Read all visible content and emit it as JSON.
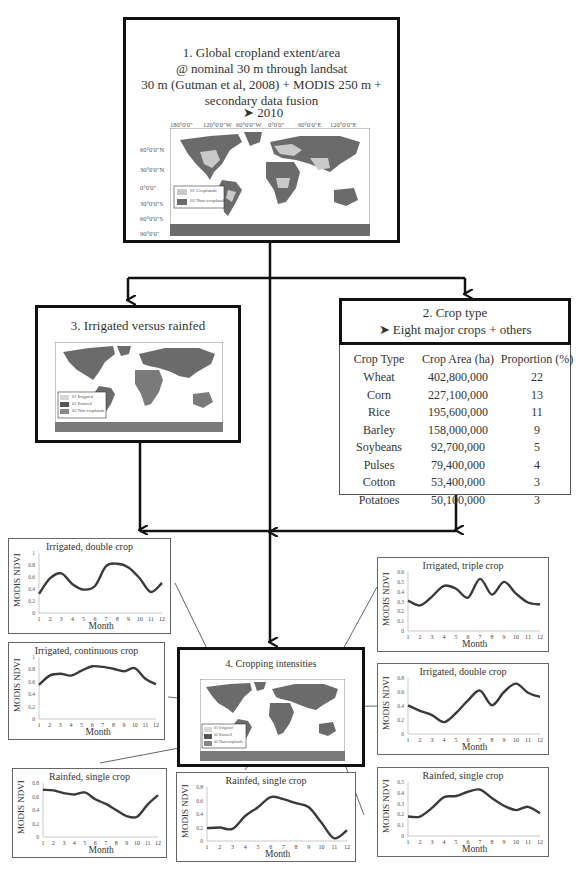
{
  "box1": {
    "title_lines": [
      "1. Global cropland extent/area",
      "@ nominal 30 m through landsat",
      "30 m  (Gutman et al, 2008) + MODIS 250 m +",
      "secondary data fusion"
    ],
    "bullets": [
      "2010",
      "1990"
    ],
    "map": {
      "top_ticks": [
        "180°0'0\"",
        "120°0'0\"W",
        "60°0'0\"W",
        "0°0'0\"",
        "60°0'0\"E",
        "120°0'0\"E"
      ],
      "left_ticks": [
        "60°0'0\"N",
        "30°0'0\"N",
        "0°0'0\"",
        "30°0'0\"S",
        "60°0'0\"S",
        "90°0'0\""
      ],
      "legend": [
        "01 Croplands",
        "02 Non-croplands"
      ]
    }
  },
  "box2": {
    "title": "2. Crop type",
    "bullet": "Eight major crops + others",
    "table": {
      "headers": [
        "Crop Type",
        "Crop Area (ha)",
        "Proportion (%)"
      ],
      "rows": [
        [
          "Wheat",
          "402,800,000",
          "22"
        ],
        [
          "Corn",
          "227,100,000",
          "13"
        ],
        [
          "Rice",
          "195,600,000",
          "11"
        ],
        [
          "Barley",
          "158,000,000",
          "9"
        ],
        [
          "Soybeans",
          "92,700,000",
          "5"
        ],
        [
          "Pulses",
          "79,400,000",
          "4"
        ],
        [
          "Cotton",
          "53,400,000",
          "3"
        ],
        [
          "Potatoes",
          "50,100,000",
          "3"
        ]
      ]
    }
  },
  "box3": {
    "title": "3. Irrigated versus rainfed",
    "legend": [
      "01 Irrigated",
      "02 Rainfed",
      "03 Non-croplands"
    ]
  },
  "box4": {
    "title": "4. Cropping intensities",
    "legend": [
      "01 Irrigated",
      "02 Rainfed",
      "03 Non-croplands"
    ]
  },
  "colors": {
    "land_dark": "#6b6b6b",
    "land_light": "#c9c9c9",
    "line": "#3a3a3a",
    "border": "#111111"
  },
  "chart_data": [
    {
      "type": "line",
      "title": "Irrigated, double crop",
      "xlabel": "Month",
      "ylabel": "MODIS NDVI",
      "x": [
        1,
        2,
        3,
        4,
        5,
        6,
        7,
        8,
        9,
        10,
        11,
        12
      ],
      "values": [
        0.32,
        0.58,
        0.66,
        0.48,
        0.39,
        0.45,
        0.78,
        0.82,
        0.76,
        0.58,
        0.35,
        0.5
      ],
      "ylim": [
        0,
        1
      ],
      "yticks": [
        "0",
        "0.2",
        "0.4",
        "0.6",
        "0.8",
        "1"
      ]
    },
    {
      "type": "line",
      "title": "Irrigated, continuous crop",
      "xlabel": "Month",
      "ylabel": "MODIS NDVI",
      "x": [
        1,
        2,
        3,
        4,
        5,
        6,
        7,
        8,
        9,
        10,
        11,
        12
      ],
      "values": [
        0.55,
        0.7,
        0.73,
        0.7,
        0.78,
        0.85,
        0.84,
        0.81,
        0.77,
        0.82,
        0.65,
        0.56
      ],
      "ylim": [
        0,
        1
      ],
      "yticks": [
        "0",
        "0.2",
        "0.4",
        "0.6",
        "0.8",
        "1"
      ]
    },
    {
      "type": "line",
      "title": "Rainfed, single crop",
      "xlabel": "Month",
      "ylabel": "MODIS NDVI",
      "x": [
        1,
        2,
        3,
        4,
        5,
        6,
        7,
        8,
        9,
        10,
        11,
        12
      ],
      "values": [
        0.7,
        0.69,
        0.65,
        0.63,
        0.66,
        0.56,
        0.49,
        0.4,
        0.31,
        0.3,
        0.48,
        0.62
      ],
      "ylim": [
        0,
        0.8
      ],
      "yticks": [
        "0",
        "0.2",
        "0.4",
        "0.6",
        "0.8"
      ]
    },
    {
      "type": "line",
      "title": "Rainfed, single crop",
      "xlabel": "Month",
      "ylabel": "MODIS NDVI",
      "x": [
        1,
        2,
        3,
        4,
        5,
        6,
        7,
        8,
        9,
        10,
        11,
        12
      ],
      "values": [
        0.19,
        0.2,
        0.18,
        0.37,
        0.5,
        0.65,
        0.62,
        0.56,
        0.5,
        0.27,
        0.04,
        0.16
      ],
      "ylim": [
        0,
        0.8
      ],
      "yticks": [
        "0",
        "0.2",
        "0.4",
        "0.6",
        "0.8"
      ]
    },
    {
      "type": "line",
      "title": "Irrigated, triple crop",
      "xlabel": "Month",
      "ylabel": "MODIS NDVI",
      "x": [
        1,
        2,
        3,
        4,
        5,
        6,
        7,
        8,
        9,
        10,
        11,
        12
      ],
      "values": [
        0.31,
        0.26,
        0.35,
        0.46,
        0.43,
        0.34,
        0.53,
        0.37,
        0.5,
        0.38,
        0.29,
        0.27
      ],
      "ylim": [
        0,
        0.6
      ],
      "yticks": [
        "0",
        "0.1",
        "0.2",
        "0.3",
        "0.4",
        "0.5",
        "0.6"
      ]
    },
    {
      "type": "line",
      "title": "Irrigated, double crop",
      "xlabel": "Month",
      "ylabel": "MODIS NDVI",
      "x": [
        1,
        2,
        3,
        4,
        5,
        6,
        7,
        8,
        9,
        10,
        11,
        12
      ],
      "values": [
        0.41,
        0.33,
        0.27,
        0.17,
        0.3,
        0.48,
        0.62,
        0.41,
        0.6,
        0.72,
        0.59,
        0.53
      ],
      "ylim": [
        0,
        0.8
      ],
      "yticks": [
        "0",
        "0.2",
        "0.4",
        "0.6",
        "0.8"
      ]
    },
    {
      "type": "line",
      "title": "Rainfed, single crop",
      "xlabel": "Month",
      "ylabel": "MODIS NDVI",
      "x": [
        1,
        2,
        3,
        4,
        5,
        6,
        7,
        8,
        9,
        10,
        11,
        12
      ],
      "values": [
        0.18,
        0.18,
        0.26,
        0.36,
        0.37,
        0.41,
        0.43,
        0.35,
        0.28,
        0.24,
        0.27,
        0.21
      ],
      "ylim": [
        0,
        0.5
      ],
      "yticks": [
        "0",
        "0.1",
        "0.2",
        "0.3",
        "0.4",
        "0.5"
      ]
    }
  ]
}
